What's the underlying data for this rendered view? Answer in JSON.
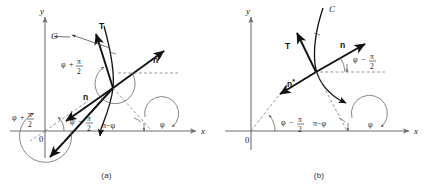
{
  "figure": {
    "type": "geometric-diagram"
  },
  "symbols": {
    "phi": "φ",
    "pi": "π",
    "minus": "−",
    "plus": "+",
    "asterisk": "*"
  },
  "panels": [
    {
      "id": "a",
      "caption": "(a)",
      "axes": {
        "x_label": "x",
        "y_label": "y",
        "origin_label": "0"
      },
      "curve_label": "C",
      "vectors": [
        {
          "name": "tangent",
          "label": "T"
        },
        {
          "name": "normal",
          "label": "n"
        },
        {
          "name": "conormal",
          "label": "n*",
          "base": "n",
          "sup": "*"
        }
      ],
      "angles": [
        {
          "name": "phi-plus-half-pi-left",
          "lead": "φ",
          "op": "+",
          "num": "π",
          "den": "2"
        },
        {
          "name": "phi-plus-half-pi-center",
          "lead": "φ",
          "op": "+",
          "num": "π",
          "den": "2"
        },
        {
          "name": "phi-minus-half-pi",
          "lead": "φ",
          "op": "−",
          "num": "π",
          "den": "2"
        },
        {
          "name": "pi-minus-phi",
          "text": "π−φ"
        },
        {
          "name": "phi",
          "text": "φ"
        }
      ]
    },
    {
      "id": "b",
      "caption": "(b)",
      "axes": {
        "x_label": "x",
        "y_label": "y",
        "origin_label": "0"
      },
      "curve_label": "C",
      "vectors": [
        {
          "name": "tangent",
          "label": "T"
        },
        {
          "name": "normal",
          "label": "n"
        },
        {
          "name": "conormal",
          "label": "n*",
          "base": "n",
          "sup": "*"
        }
      ],
      "angles": [
        {
          "name": "phi-minus-half-pi-upper",
          "lead": "φ",
          "op": "−",
          "num": "π",
          "den": "2"
        },
        {
          "name": "phi-minus-half-pi-lower",
          "lead": "φ",
          "op": "−",
          "num": "π",
          "den": "2"
        },
        {
          "name": "pi-minus-phi",
          "text": "π−φ"
        },
        {
          "name": "phi",
          "text": "φ"
        }
      ]
    }
  ],
  "colors": {
    "ink": "#111111",
    "axis": "#6e6e6e",
    "arc": "#555555",
    "background": "#ffffff"
  }
}
